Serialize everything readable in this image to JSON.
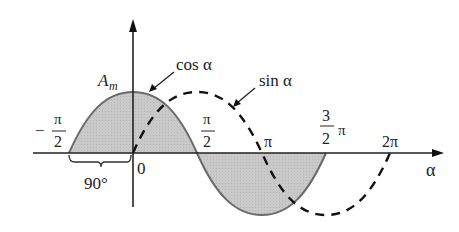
{
  "diagram": {
    "type": "phase-relationship-sine-cosine",
    "curves": [
      {
        "name": "cos α",
        "style": "solid",
        "shaded": true,
        "color": "#666666",
        "fill": "#cccccc"
      },
      {
        "name": "sin α",
        "style": "dashed",
        "shaded": false,
        "color": "#111111"
      }
    ],
    "labels": {
      "amplitude": "A",
      "amplitude_sub": "m",
      "cos": "cos α",
      "sin": "sin α",
      "axis": "α",
      "origin": "0",
      "neg_half_pi_sign": "−",
      "pi_sym": "π",
      "two": "2",
      "three": "3",
      "pi": "π",
      "two_pi": "2π",
      "phase_shift": "90°"
    },
    "ticks": [
      "−π/2",
      "0",
      "π/2",
      "π",
      "3π/2",
      "2π"
    ]
  }
}
